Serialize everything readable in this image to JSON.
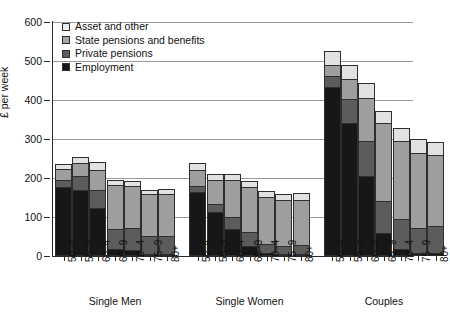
{
  "chart_data": {
    "type": "bar",
    "subtype": "stacked",
    "title": "",
    "xlabel": "",
    "ylabel": "£ per week",
    "ylim": [
      0,
      600
    ],
    "yticks": [
      0,
      100,
      200,
      300,
      400,
      500,
      600
    ],
    "grid": true,
    "legend_position": "top-left",
    "categories": [
      "50–4",
      "55–9",
      "60–4",
      "65–9",
      "70–4",
      "75–9",
      "80+"
    ],
    "groups": [
      "Single Men",
      "Single Women",
      "Couples"
    ],
    "series": [
      {
        "name": "Employment",
        "color": "#171717"
      },
      {
        "name": "Private pensions",
        "color": "#5c5c5c"
      },
      {
        "name": "State pensions and benefits",
        "color": "#9e9e9e"
      },
      {
        "name": "Asset and other",
        "color": "#e2e2e2"
      }
    ],
    "data": {
      "Single Men": {
        "50–4": {
          "employment": 178,
          "private": 18,
          "state": 29,
          "asset": 12,
          "total": 237
        },
        "55–9": {
          "employment": 170,
          "private": 38,
          "state": 32,
          "asset": 15,
          "total": 255
        },
        "60–4": {
          "employment": 122,
          "private": 48,
          "state": 52,
          "asset": 19,
          "total": 241
        },
        "65–9": {
          "employment": 17,
          "private": 52,
          "state": 116,
          "asset": 11,
          "total": 196
        },
        "70–4": {
          "employment": 12,
          "private": 60,
          "state": 110,
          "asset": 10,
          "total": 192
        },
        "75–9": {
          "employment": 3,
          "private": 47,
          "state": 110,
          "asset": 9,
          "total": 169
        },
        "80+": {
          "employment": 3,
          "private": 47,
          "state": 112,
          "asset": 11,
          "total": 173
        }
      },
      "Single Women": {
        "50–4": {
          "employment": 166,
          "private": 14,
          "state": 42,
          "asset": 17,
          "total": 239
        },
        "55–9": {
          "employment": 112,
          "private": 22,
          "state": 62,
          "asset": 15,
          "total": 211
        },
        "60–4": {
          "employment": 68,
          "private": 32,
          "state": 96,
          "asset": 14,
          "total": 210
        },
        "65–9": {
          "employment": 24,
          "private": 36,
          "state": 120,
          "asset": 12,
          "total": 192
        },
        "70–4": {
          "employment": 4,
          "private": 26,
          "state": 124,
          "asset": 13,
          "total": 167
        },
        "75–9": {
          "employment": 3,
          "private": 22,
          "state": 122,
          "asset": 12,
          "total": 159
        },
        "80+": {
          "employment": 3,
          "private": 24,
          "state": 120,
          "asset": 14,
          "total": 161
        }
      },
      "Couples": {
        "50–4": {
          "employment": 434,
          "private": 30,
          "state": 28,
          "asset": 33,
          "total": 525
        },
        "55–9": {
          "employment": 342,
          "private": 62,
          "state": 52,
          "asset": 34,
          "total": 490
        },
        "60–4": {
          "employment": 205,
          "private": 90,
          "state": 112,
          "asset": 36,
          "total": 443
        },
        "65–9": {
          "employment": 57,
          "private": 84,
          "state": 202,
          "asset": 30,
          "total": 373
        },
        "70–4": {
          "employment": 16,
          "private": 78,
          "state": 204,
          "asset": 30,
          "total": 328
        },
        "75–9": {
          "employment": 6,
          "private": 64,
          "state": 197,
          "asset": 32,
          "total": 299
        },
        "80+": {
          "employment": 6,
          "private": 70,
          "state": 184,
          "asset": 33,
          "total": 293
        }
      }
    }
  },
  "legend": {
    "items": [
      {
        "label": "Asset and other",
        "key": "asset"
      },
      {
        "label": "State pensions and benefits",
        "key": "state"
      },
      {
        "label": "Private pensions",
        "key": "private"
      },
      {
        "label": "Employment",
        "key": "employ"
      }
    ]
  }
}
